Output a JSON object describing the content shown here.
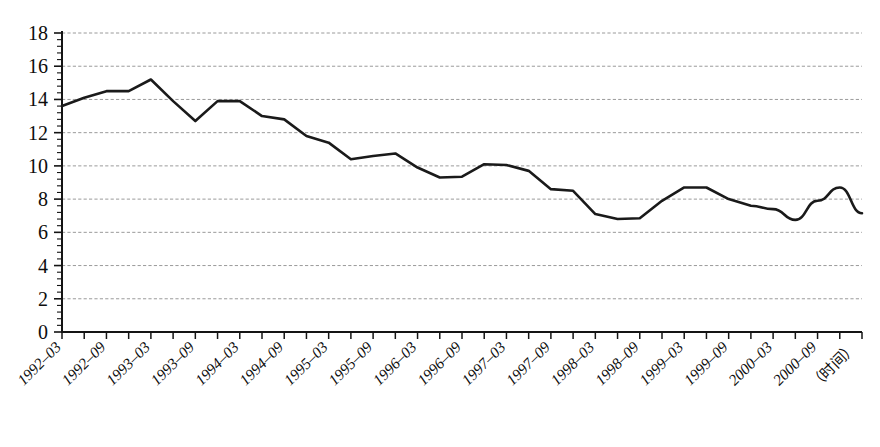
{
  "chart_data": {
    "type": "line",
    "title": "",
    "subtitle": "",
    "xlabel": "（时间）",
    "ylabel": "",
    "ylim": [
      0,
      18
    ],
    "ytick_step": 2,
    "ytick_labels": [
      "0",
      "2",
      "4",
      "6",
      "8",
      "10",
      "12",
      "14",
      "16",
      "18"
    ],
    "grid": true,
    "grid_style": "dashed-horizontal",
    "legend": "none",
    "minor_ticks": {
      "y_axis": "dense minor ticks along left axis",
      "x_axis": "monthly ticks, labels every 6 months"
    },
    "line_color": "#1a1a1a",
    "line_width": 2.6,
    "x": [
      "1992-03",
      "1992-06",
      "1992-09",
      "1992-12",
      "1993-03",
      "1993-06",
      "1993-09",
      "1993-12",
      "1994-03",
      "1994-06",
      "1994-09",
      "1994-12",
      "1995-03",
      "1995-06",
      "1995-09",
      "1995-12",
      "1996-03",
      "1996-06",
      "1996-09",
      "1996-12",
      "1997-03",
      "1997-06",
      "1997-09",
      "1997-12",
      "1998-03",
      "1998-06",
      "1998-09",
      "1998-12",
      "1999-03",
      "1999-06",
      "1999-09",
      "1999-12",
      "2000-03",
      "2000-06",
      "2000-09",
      "2000-12",
      "2001-03"
    ],
    "values": [
      13.6,
      14.1,
      14.5,
      14.5,
      15.2,
      13.9,
      12.7,
      13.9,
      13.9,
      13.0,
      12.8,
      11.8,
      11.4,
      10.4,
      10.6,
      10.75,
      9.9,
      9.3,
      9.35,
      10.1,
      10.05,
      9.7,
      8.6,
      8.5,
      7.1,
      6.8,
      6.85,
      7.9,
      8.7,
      8.7,
      8.0,
      7.6,
      7.4,
      6.75,
      7.9,
      8.7,
      7.15
    ],
    "xtick_labels": [
      "1992–03",
      "1992–09",
      "1993–03",
      "1993–09",
      "1994–03",
      "1994–09",
      "1995–03",
      "1995–09",
      "1996–03",
      "1996–09",
      "1997–03",
      "1997–09",
      "1998–03",
      "1998–09",
      "1999–03",
      "1999–09",
      "2000–03",
      "2000–09"
    ],
    "xtick_label_rotation_deg": -45,
    "x_axis_caption": "（时间）"
  }
}
